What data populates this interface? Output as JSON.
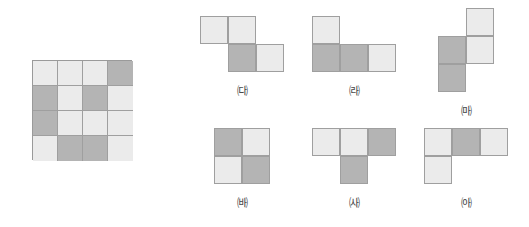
{
  "page": {
    "background_color": "#ffffff",
    "width": 529,
    "height": 227
  },
  "colors": {
    "light_tile": "#ebebeb",
    "dark_tile": "#b4b4b4",
    "tile_border": "#9f9f9f",
    "label_text": "#4a4a4a"
  },
  "main_grid": {
    "name": "main-pattern-grid",
    "rows": 4,
    "cols": 4,
    "cell_size_px": 25,
    "legend": {
      "L": "light",
      "D": "dark"
    },
    "cells": [
      [
        "L",
        "L",
        "L",
        "D"
      ],
      [
        "D",
        "L",
        "D",
        "L"
      ],
      [
        "D",
        "L",
        "L",
        "L"
      ],
      [
        "L",
        "D",
        "D",
        "L"
      ]
    ]
  },
  "options": [
    {
      "id": "g",
      "label": "㈐",
      "label_text": "ㄱ",
      "shape_name": "s-tetromino-horizontal",
      "cell_count": 4,
      "cells": [
        {
          "row": 0,
          "col": 0,
          "shade": "L"
        },
        {
          "row": 0,
          "col": 1,
          "shade": "L"
        },
        {
          "row": 1,
          "col": 1,
          "shade": "D"
        },
        {
          "row": 1,
          "col": 2,
          "shade": "L"
        }
      ]
    },
    {
      "id": "n",
      "label": "㈑",
      "label_text": "ㄴ",
      "shape_name": "j-tetromino",
      "cell_count": 4,
      "cells": [
        {
          "row": 0,
          "col": 0,
          "shade": "L"
        },
        {
          "row": 1,
          "col": 0,
          "shade": "D"
        },
        {
          "row": 1,
          "col": 1,
          "shade": "D"
        },
        {
          "row": 1,
          "col": 2,
          "shade": "L"
        }
      ]
    },
    {
      "id": "d",
      "label": "㈒",
      "label_text": "ㄷ",
      "shape_name": "s-tetromino-vertical",
      "cell_count": 4,
      "cells": [
        {
          "row": 0,
          "col": 1,
          "shade": "L"
        },
        {
          "row": 1,
          "col": 0,
          "shade": "D"
        },
        {
          "row": 1,
          "col": 1,
          "shade": "L"
        },
        {
          "row": 2,
          "col": 0,
          "shade": "D"
        }
      ]
    },
    {
      "id": "r",
      "label": "㈓",
      "label_text": "ㄹ",
      "shape_name": "o-tetromino-square",
      "cell_count": 4,
      "cells": [
        {
          "row": 0,
          "col": 0,
          "shade": "D"
        },
        {
          "row": 0,
          "col": 1,
          "shade": "L"
        },
        {
          "row": 1,
          "col": 0,
          "shade": "L"
        },
        {
          "row": 1,
          "col": 1,
          "shade": "D"
        }
      ]
    },
    {
      "id": "m",
      "label": "㈔",
      "label_text": "ㅁ",
      "shape_name": "t-tetromino",
      "cell_count": 4,
      "cells": [
        {
          "row": 0,
          "col": 0,
          "shade": "L"
        },
        {
          "row": 0,
          "col": 1,
          "shade": "L"
        },
        {
          "row": 0,
          "col": 2,
          "shade": "D"
        },
        {
          "row": 1,
          "col": 1,
          "shade": "D"
        }
      ]
    },
    {
      "id": "b",
      "label": "㈕",
      "label_text": "ㅂ",
      "shape_name": "j-tetromino-mirrored",
      "cell_count": 4,
      "cells": [
        {
          "row": 0,
          "col": 0,
          "shade": "L"
        },
        {
          "row": 0,
          "col": 1,
          "shade": "D"
        },
        {
          "row": 0,
          "col": 2,
          "shade": "L"
        },
        {
          "row": 1,
          "col": 0,
          "shade": "L"
        }
      ]
    }
  ]
}
